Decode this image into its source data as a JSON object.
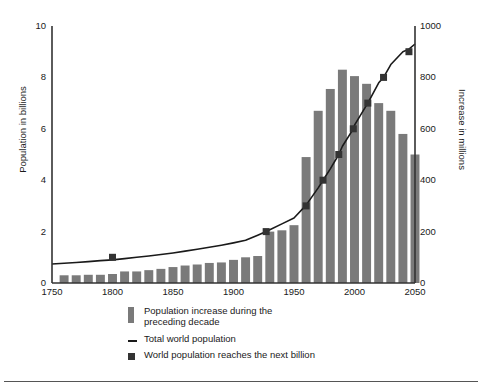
{
  "chart_data": {
    "type": "bar",
    "title": "",
    "subtitle": "",
    "xlabel": "",
    "ylabel": "Population in billions",
    "ylabel_right": "Increase in millions",
    "xlim": [
      1750,
      2050
    ],
    "ylim": [
      0,
      10
    ],
    "ylim_right": [
      0,
      1000
    ],
    "xticks": [
      1750,
      1800,
      1850,
      1900,
      1950,
      2000,
      2050
    ],
    "yticks": [
      0,
      2,
      4,
      6,
      8,
      10
    ],
    "yticks_right": [
      0,
      200,
      400,
      600,
      800,
      1000
    ],
    "grid": false,
    "legend_position": "below-center",
    "series": [
      {
        "name": "Population increase during the preceding decade",
        "type": "bar",
        "axis": "right",
        "unit": "millions",
        "x": [
          1760,
          1770,
          1780,
          1790,
          1800,
          1810,
          1820,
          1830,
          1840,
          1850,
          1860,
          1870,
          1880,
          1890,
          1900,
          1910,
          1920,
          1930,
          1940,
          1950,
          1960,
          1970,
          1980,
          1990,
          2000,
          2010,
          2020,
          2030,
          2040,
          2050
        ],
        "values": [
          30,
          30,
          32,
          32,
          35,
          45,
          45,
          50,
          55,
          62,
          68,
          72,
          78,
          80,
          90,
          100,
          105,
          200,
          205,
          225,
          490,
          670,
          755,
          830,
          805,
          775,
          700,
          670,
          580,
          500
        ]
      },
      {
        "name": "Total world population",
        "type": "line",
        "axis": "left",
        "unit": "billions",
        "x": [
          1750,
          1760,
          1770,
          1780,
          1790,
          1800,
          1810,
          1820,
          1830,
          1840,
          1850,
          1860,
          1870,
          1880,
          1890,
          1900,
          1910,
          1920,
          1927,
          1930,
          1940,
          1950,
          1960,
          1970,
          1974,
          1980,
          1987,
          1990,
          1999,
          2000,
          2010,
          2011,
          2020,
          2024,
          2030,
          2040,
          2045,
          2050
        ],
        "values": [
          0.74,
          0.77,
          0.8,
          0.83,
          0.87,
          0.9,
          0.95,
          1.0,
          1.05,
          1.11,
          1.17,
          1.24,
          1.31,
          1.39,
          1.47,
          1.56,
          1.66,
          1.86,
          2.0,
          2.07,
          2.3,
          2.53,
          3.03,
          3.7,
          4.0,
          4.44,
          5.0,
          5.32,
          6.0,
          6.14,
          6.92,
          7.0,
          7.79,
          8.0,
          8.5,
          9.0,
          9.1,
          9.3
        ]
      },
      {
        "name": "World population reaches the next billion",
        "type": "scatter",
        "axis": "left",
        "marker": "square",
        "unit": "billions",
        "x": [
          1800,
          1927,
          1960,
          1974,
          1987,
          1999,
          2011,
          2024,
          2045
        ],
        "values": [
          1,
          2,
          3,
          4,
          5,
          6,
          7,
          8,
          9
        ]
      }
    ],
    "legend": [
      {
        "label": "Population increase during the\npreceding decade",
        "swatch": "bar-swatch"
      },
      {
        "label": "Total world population",
        "swatch": "line-swatch"
      },
      {
        "label": "World population reaches the next billion",
        "swatch": "square-swatch"
      }
    ],
    "colors": {
      "bar": "#7a7a7a",
      "line": "#1a1a1a",
      "marker": "#333333",
      "axis": "#333333",
      "background": "#ffffff"
    }
  }
}
